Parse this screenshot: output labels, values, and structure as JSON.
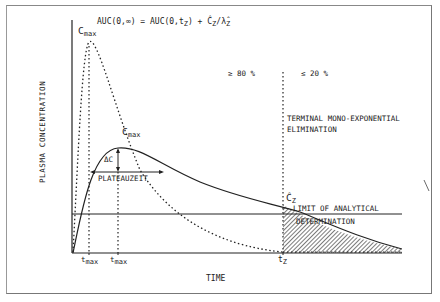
{
  "diagram": {
    "type": "pharmacokinetic-concentration-time-curve",
    "equation": {
      "lhs": "AUC(0,∞)",
      "equals": "=",
      "term1": "AUC(0,t",
      "term1_sub": "Z",
      "term1_close": ")",
      "plus": "+",
      "term2_c": "Ĉ",
      "term2_c_sub": "Z",
      "term2_slash": "/",
      "term2_lambda": "λ̂",
      "term2_lambda_sub": "Z"
    },
    "y_axis_label": "PLASMA CONCENTRATION",
    "x_axis_label": "TIME",
    "labels": {
      "cmax_fast": "C",
      "cmax_fast_sub": "max",
      "cmax_slow": "C",
      "cmax_slow_sub": "max",
      "delta_c": "ΔC",
      "plateauzeit": "PLATEAUZEIT",
      "pct_80": "≥ 80 %",
      "pct_20": "≤ 20 %",
      "terminal_line1": "TERMINAL MONO-EXPONENTIAL",
      "terminal_line2": "ELIMINATION",
      "cz": "Ĉ",
      "cz_sub": "Z",
      "loq_line1": "LIMIT OF ANALYTICAL",
      "loq_line2": "DETERMINATION",
      "tmax_fast": "t",
      "tmax_fast_sub": "max",
      "tmax_slow": "t",
      "tmax_slow_sub": "max",
      "tz": "t",
      "tz_sub": "Z"
    },
    "series": [
      {
        "name": "fast-absorption-curve",
        "style": "dotted",
        "peak": "Cmax at tmax (early, high)"
      },
      {
        "name": "slow-absorption-curve",
        "style": "solid",
        "peak": "Cmax at tmax (later, lower)"
      }
    ],
    "colors": {
      "ink": "#222222",
      "frame": "#888888",
      "background": "#ffffff"
    }
  }
}
